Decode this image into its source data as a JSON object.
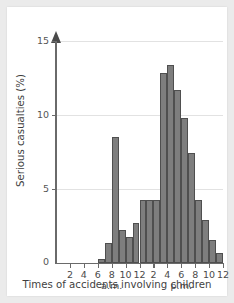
{
  "chart_data": {
    "type": "bar",
    "title": "",
    "xlabel": "Times of accidents involving children",
    "ylabel": "Serious casualties (%)",
    "ylim": [
      0,
      15.5
    ],
    "ytick_values": [
      0,
      5,
      10,
      15
    ],
    "ytick_labels": [
      "0",
      "5",
      "10",
      "15"
    ],
    "grid": "horizontal",
    "legend": "none",
    "xlim": [
      0,
      24
    ],
    "xtick_values": [
      2,
      4,
      6,
      8,
      10,
      12,
      14,
      16,
      18,
      20,
      22,
      24
    ],
    "xtick_labels": [
      "2",
      "4",
      "6",
      "8",
      "10",
      "12",
      "2",
      "4",
      "6",
      "8",
      "10",
      "12"
    ],
    "period_labels": [
      {
        "label": "a.m.",
        "at": 8
      },
      {
        "label": "p.m.",
        "at": 18
      }
    ],
    "bin_width_hours": 1,
    "categories": [
      "0-1",
      "1-2",
      "2-3",
      "3-4",
      "4-5",
      "5-6",
      "6-7",
      "7-8",
      "8-9",
      "9-10",
      "10-11",
      "11-12",
      "12-13",
      "13-14",
      "14-15",
      "15-16",
      "16-17",
      "17-18",
      "18-19",
      "19-20",
      "20-21",
      "21-22",
      "22-23",
      "23-24"
    ],
    "values": [
      0,
      0,
      0,
      0,
      0,
      0,
      0.3,
      1.4,
      8.8,
      2.3,
      1.8,
      2.8,
      4.4,
      4.4,
      4.4,
      13.3,
      13.8,
      12.1,
      10.1,
      7.7,
      4.4,
      3.0,
      1.6,
      0.7
    ]
  },
  "style": {
    "bar_fill": "#7e7e7e",
    "bar_edge": "#4f4f4f",
    "axis_color": "#6a6a6a",
    "grid_color": "#e2e2e2",
    "text_color": "#3f3f3f",
    "plate_background": "#ffffff",
    "figure_background": "#ebebeb"
  }
}
